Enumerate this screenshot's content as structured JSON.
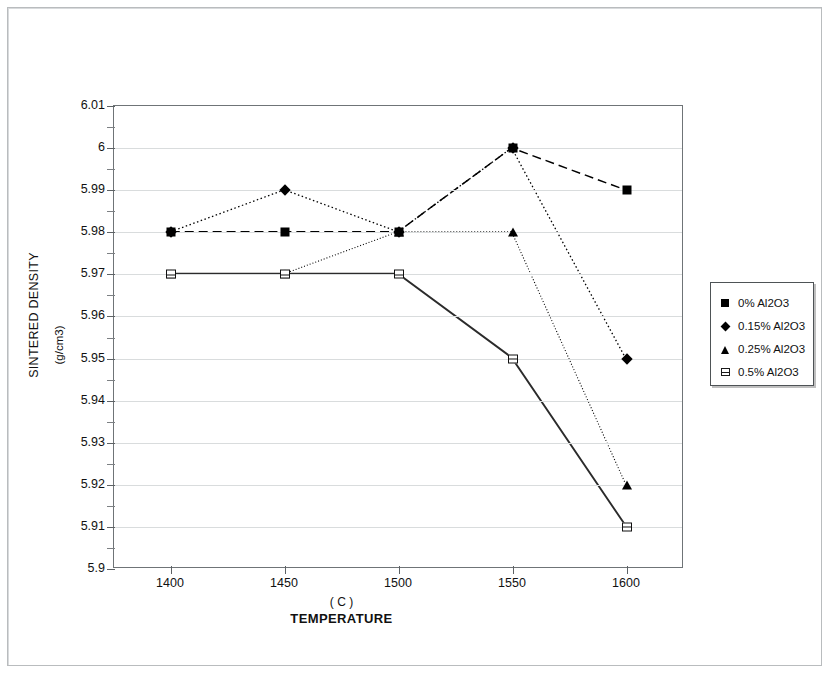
{
  "chart_data": {
    "type": "line",
    "title": "",
    "xlabel": "TEMPERATURE",
    "xunits": "( C )",
    "ylabel": "SINTERED DENSITY",
    "yunits": "(g/cm3)",
    "x": [
      1400,
      1450,
      1500,
      1550,
      1600
    ],
    "xtick_labels": [
      "1400",
      "1450",
      "1500",
      "1550",
      "1600"
    ],
    "xlim": [
      1375,
      1625
    ],
    "ylim": [
      5.9,
      6.01
    ],
    "ytick_labels": [
      "6.01",
      "6",
      "5.99",
      "5.98",
      "5.97",
      "5.96",
      "5.95",
      "5.94",
      "5.93",
      "5.92",
      "5.91",
      "5.9"
    ],
    "ytick_values": [
      6.01,
      6.0,
      5.99,
      5.98,
      5.97,
      5.96,
      5.95,
      5.94,
      5.93,
      5.92,
      5.91,
      5.9
    ],
    "yminor_step": 0.005,
    "grid": true,
    "legend_position": "right",
    "series": [
      {
        "name": "0% Al2O3",
        "marker": "filled-square",
        "linestyle": "dashed",
        "color": "#000000",
        "values": [
          5.98,
          5.98,
          5.98,
          6.0,
          5.99
        ]
      },
      {
        "name": "0.15% Al2O3",
        "marker": "filled-diamond",
        "linestyle": "dotted",
        "color": "#000000",
        "values": [
          5.98,
          5.99,
          5.98,
          6.0,
          5.95
        ]
      },
      {
        "name": "0.25% Al2O3",
        "marker": "filled-triangle",
        "linestyle": "dash-dot",
        "color": "#000000",
        "values": [
          5.97,
          5.97,
          5.98,
          5.98,
          5.92
        ]
      },
      {
        "name": "0.5% Al2O3",
        "marker": "open-square",
        "linestyle": "solid",
        "color": "#2b2b2b",
        "values": [
          5.97,
          5.97,
          5.97,
          5.95,
          5.91
        ]
      }
    ]
  },
  "legend": {
    "items": [
      {
        "label": "0% Al2O3",
        "marker": "filled-square"
      },
      {
        "label": "0.15% Al2O3",
        "marker": "filled-diamond"
      },
      {
        "label": "0.25% Al2O3",
        "marker": "filled-triangle"
      },
      {
        "label": "0.5% Al2O3",
        "marker": "open-square"
      }
    ]
  }
}
